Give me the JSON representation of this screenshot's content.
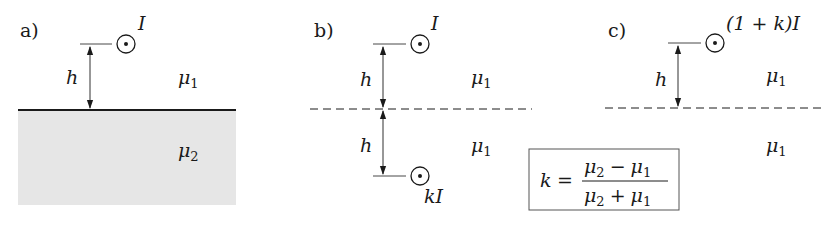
{
  "figure": {
    "panels": [
      {
        "id": "a",
        "label": "a)",
        "current_label": "I",
        "distance_label": "h",
        "upper_medium": {
          "symbol": "μ",
          "subscript": "1"
        },
        "lower_medium": {
          "symbol": "μ",
          "subscript": "2"
        },
        "interface": "solid",
        "lower_fill_color": "#e6e6e6"
      },
      {
        "id": "b",
        "label": "b)",
        "current_label": "I",
        "image_current_label": "kI",
        "distance_label_top": "h",
        "distance_label_bottom": "h",
        "upper_medium": {
          "symbol": "μ",
          "subscript": "1"
        },
        "lower_medium": {
          "symbol": "μ",
          "subscript": "1"
        },
        "interface": "dashed"
      },
      {
        "id": "c",
        "label": "c)",
        "current_label": "(1 + k)I",
        "distance_label": "h",
        "upper_medium": {
          "symbol": "μ",
          "subscript": "1"
        },
        "lower_medium": {
          "symbol": "μ",
          "subscript": "1"
        },
        "interface": "dashed"
      }
    ],
    "formula": {
      "lhs": "k",
      "equals": "=",
      "numerator": {
        "a": "μ",
        "a_sub": "2",
        "op": "−",
        "b": "μ",
        "b_sub": "1"
      },
      "denominator": {
        "a": "μ",
        "a_sub": "2",
        "op": "+",
        "b": "μ",
        "b_sub": "1"
      }
    },
    "colors": {
      "ink": "#1a1a1a",
      "fill": "#e6e6e6",
      "box_border": "#555555"
    }
  }
}
